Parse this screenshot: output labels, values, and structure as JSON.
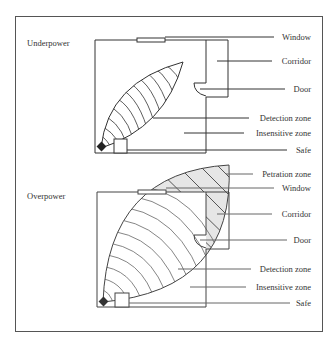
{
  "panels": [
    {
      "title": "Underpower",
      "labels": {
        "window": "Window",
        "corridor": "Corridor",
        "door": "Door",
        "detection_zone": "Detection zone",
        "insensitive_zone": "Insensitive zone",
        "safe": "Safe"
      }
    },
    {
      "title": "Overpower",
      "labels": {
        "petration_zone": "Petration zone",
        "window": "Window",
        "corridor": "Corridor",
        "door": "Door",
        "detection_zone": "Detection zone",
        "insensitive_zone": "Insensitive zone",
        "safe": "Safe"
      }
    }
  ],
  "colors": {
    "line": "#333333",
    "hatch_fill": "#e6e6e6"
  }
}
